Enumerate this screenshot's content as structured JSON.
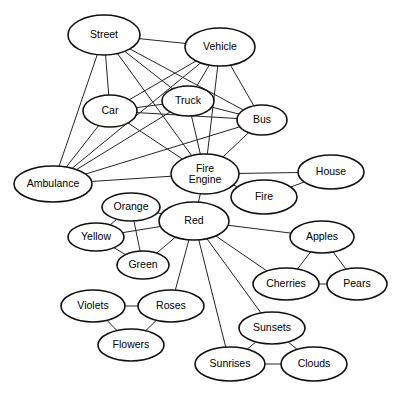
{
  "diagram": {
    "type": "node-link-graph",
    "background_color": "#ffffff",
    "node_fill_color": "#ffffff",
    "node_stroke_color": "#111111",
    "edge_color": "#262626",
    "caption": ""
  },
  "nodes": [
    {
      "id": "street",
      "label": "Street",
      "cx": 104,
      "cy": 35,
      "rx": 36,
      "ry": 20
    },
    {
      "id": "vehicle",
      "label": "Vehicle",
      "cx": 220,
      "cy": 47,
      "rx": 35,
      "ry": 19
    },
    {
      "id": "car",
      "label": "Car",
      "cx": 110,
      "cy": 111,
      "rx": 27,
      "ry": 16
    },
    {
      "id": "truck",
      "label": "Truck",
      "cx": 188,
      "cy": 101,
      "rx": 26,
      "ry": 15
    },
    {
      "id": "bus",
      "label": "Bus",
      "cx": 262,
      "cy": 120,
      "rx": 25,
      "ry": 15
    },
    {
      "id": "ambulance",
      "label": "Ambulance",
      "cx": 53,
      "cy": 184,
      "rx": 39,
      "ry": 18
    },
    {
      "id": "fire-engine",
      "label": "Fire\nEngine",
      "cx": 205,
      "cy": 174,
      "rx": 34,
      "ry": 20
    },
    {
      "id": "house",
      "label": "House",
      "cx": 331,
      "cy": 172,
      "rx": 33,
      "ry": 17
    },
    {
      "id": "fire",
      "label": "Fire",
      "cx": 264,
      "cy": 197,
      "rx": 33,
      "ry": 17
    },
    {
      "id": "orange",
      "label": "Orange",
      "cx": 131,
      "cy": 207,
      "rx": 29,
      "ry": 14
    },
    {
      "id": "red",
      "label": "Red",
      "cx": 194,
      "cy": 221,
      "rx": 35,
      "ry": 19
    },
    {
      "id": "yellow",
      "label": "Yellow",
      "cx": 96,
      "cy": 237,
      "rx": 28,
      "ry": 14
    },
    {
      "id": "green",
      "label": "Green",
      "cx": 143,
      "cy": 265,
      "rx": 26,
      "ry": 14
    },
    {
      "id": "apples",
      "label": "Apples",
      "cx": 322,
      "cy": 237,
      "rx": 32,
      "ry": 16
    },
    {
      "id": "cherries",
      "label": "Cherries",
      "cx": 286,
      "cy": 284,
      "rx": 33,
      "ry": 16
    },
    {
      "id": "pears",
      "label": "Pears",
      "cx": 357,
      "cy": 284,
      "rx": 30,
      "ry": 16
    },
    {
      "id": "violets",
      "label": "Violets",
      "cx": 93,
      "cy": 306,
      "rx": 32,
      "ry": 16
    },
    {
      "id": "roses",
      "label": "Roses",
      "cx": 171,
      "cy": 306,
      "rx": 33,
      "ry": 16
    },
    {
      "id": "flowers",
      "label": "Flowers",
      "cx": 131,
      "cy": 345,
      "rx": 33,
      "ry": 16
    },
    {
      "id": "sunsets",
      "label": "Sunsets",
      "cx": 272,
      "cy": 328,
      "rx": 33,
      "ry": 16
    },
    {
      "id": "sunrises",
      "label": "Sunrises",
      "cx": 230,
      "cy": 364,
      "rx": 35,
      "ry": 17
    },
    {
      "id": "clouds",
      "label": "Clouds",
      "cx": 314,
      "cy": 364,
      "rx": 33,
      "ry": 17
    }
  ],
  "edges": [
    {
      "from": "street",
      "to": "vehicle"
    },
    {
      "from": "street",
      "to": "car"
    },
    {
      "from": "street",
      "to": "truck"
    },
    {
      "from": "street",
      "to": "bus"
    },
    {
      "from": "street",
      "to": "ambulance"
    },
    {
      "from": "street",
      "to": "fire-engine"
    },
    {
      "from": "vehicle",
      "to": "car"
    },
    {
      "from": "vehicle",
      "to": "truck"
    },
    {
      "from": "vehicle",
      "to": "bus"
    },
    {
      "from": "vehicle",
      "to": "ambulance"
    },
    {
      "from": "vehicle",
      "to": "fire-engine"
    },
    {
      "from": "car",
      "to": "truck"
    },
    {
      "from": "car",
      "to": "bus"
    },
    {
      "from": "car",
      "to": "ambulance"
    },
    {
      "from": "car",
      "to": "fire-engine"
    },
    {
      "from": "truck",
      "to": "bus"
    },
    {
      "from": "truck",
      "to": "ambulance"
    },
    {
      "from": "truck",
      "to": "fire-engine"
    },
    {
      "from": "bus",
      "to": "ambulance"
    },
    {
      "from": "bus",
      "to": "fire-engine"
    },
    {
      "from": "ambulance",
      "to": "fire-engine"
    },
    {
      "from": "fire-engine",
      "to": "house"
    },
    {
      "from": "fire-engine",
      "to": "fire"
    },
    {
      "from": "fire-engine",
      "to": "red"
    },
    {
      "from": "fire",
      "to": "house"
    },
    {
      "from": "red",
      "to": "orange"
    },
    {
      "from": "red",
      "to": "yellow"
    },
    {
      "from": "red",
      "to": "green"
    },
    {
      "from": "red",
      "to": "apples"
    },
    {
      "from": "red",
      "to": "cherries"
    },
    {
      "from": "red",
      "to": "roses"
    },
    {
      "from": "red",
      "to": "sunsets"
    },
    {
      "from": "red",
      "to": "sunrises"
    },
    {
      "from": "orange",
      "to": "yellow"
    },
    {
      "from": "orange",
      "to": "green"
    },
    {
      "from": "yellow",
      "to": "green"
    },
    {
      "from": "apples",
      "to": "cherries"
    },
    {
      "from": "apples",
      "to": "pears"
    },
    {
      "from": "cherries",
      "to": "pears"
    },
    {
      "from": "violets",
      "to": "roses"
    },
    {
      "from": "violets",
      "to": "flowers"
    },
    {
      "from": "roses",
      "to": "flowers"
    },
    {
      "from": "sunsets",
      "to": "sunrises"
    },
    {
      "from": "sunsets",
      "to": "clouds"
    },
    {
      "from": "sunrises",
      "to": "clouds"
    }
  ]
}
